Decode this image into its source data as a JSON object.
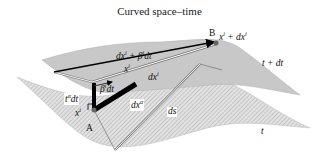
{
  "title": "Curved space–time",
  "surfaces": {
    "upper": {
      "label": "t + dt",
      "fill": "#c8c8c8"
    },
    "lower": {
      "label": "t",
      "fill": "#d6d6d6",
      "pattern": "hatched"
    }
  },
  "points": {
    "A": {
      "label": "A",
      "coord": "x^i"
    },
    "B": {
      "label": "B",
      "coord": "x^i + dx^i"
    }
  },
  "vectors": {
    "dx_plus_beta": "dx^i + β^i dt",
    "x_i_mid": "x^i",
    "dx_i": "dx^i",
    "beta_dt": "β^i dt",
    "t_alpha_dt": "t^α dt",
    "dx_alpha": "dx^α",
    "ds": "ds"
  },
  "labels_display": {
    "upper_surface": "t + dt",
    "lower_surface": "t",
    "A": "A",
    "B": "B",
    "B_coord_base": "x",
    "B_coord_sup": "i",
    "B_coord_rest": " + dx",
    "B_coord_sup2": "i",
    "A_coord_base": "x",
    "A_coord_sup": "i",
    "dxb_base": "dx",
    "dxb_sup": "i",
    "dxb_mid": " + β",
    "dxb_sup2": "i",
    "dxb_end": "dt",
    "xi_base": "x",
    "xi_sup": "i",
    "dxi_base": "dx",
    "dxi_sup": "i",
    "beta_base": "β",
    "beta_sup": "i",
    "beta_end": "dt",
    "ta_base": "t",
    "ta_sup": "α",
    "ta_end": "dt",
    "dxa_base": "dx",
    "dxa_sup": "α",
    "ds": "ds"
  }
}
